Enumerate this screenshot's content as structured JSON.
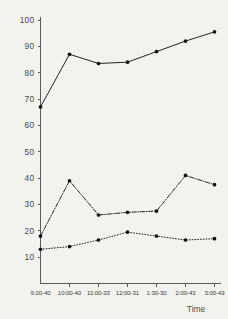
{
  "chart_data": {
    "type": "line",
    "title": "",
    "xlabel": "Time",
    "ylabel": "",
    "categories": [
      "9:20-40",
      "10:00-40",
      "11:00-33",
      "12:00-31",
      "1:30-30",
      "2:00-43",
      "3:00-43"
    ],
    "ylim": [
      0,
      100
    ],
    "yticks": [
      10,
      20,
      30,
      40,
      50,
      60,
      70,
      80,
      90,
      100
    ],
    "ytick_labels": [
      "10",
      "20",
      "30",
      "40",
      "50",
      "60",
      "70",
      "80",
      "90",
      "100"
    ],
    "grid": false,
    "legend": "none",
    "series": [
      {
        "name": "series-1",
        "style": "solid",
        "marker": "filled-circle",
        "color": "#17171a",
        "values": [
          67,
          87,
          83.5,
          84,
          88,
          92,
          95.5
        ]
      },
      {
        "name": "series-2",
        "style": "dash-dot",
        "marker": "filled-circle",
        "color": "#17171a",
        "values": [
          18,
          39,
          26,
          27,
          27.5,
          41,
          37.5
        ]
      },
      {
        "name": "series-3",
        "style": "dotted",
        "marker": "filled-circle",
        "color": "#17171a",
        "values": [
          13,
          14,
          16.5,
          19.5,
          18,
          16.5,
          17
        ]
      }
    ]
  },
  "figure": {
    "background_color": "#f2f2ef",
    "axis_color": "#5a5a5a",
    "x_axis_title": "Time"
  }
}
